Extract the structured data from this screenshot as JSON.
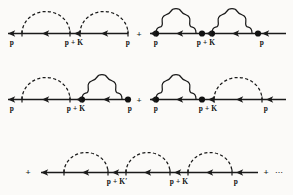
{
  "figure": {
    "kind": "feynman-diagram-series",
    "background_color": "#fbfaf8",
    "ink_color": "#1a1a1a",
    "width": 293,
    "height": 195
  },
  "symbols": {
    "plus": "+",
    "ellipsis": "⋯",
    "momentum_p": "p",
    "momentum_p_plus_K": "p + K",
    "momentum_p_plus_K_prime": "p + K′"
  },
  "rows": [
    {
      "name": "row-1",
      "diagrams": [
        {
          "name": "diagram-1-1",
          "propagator_style": "dashed",
          "loops": 2,
          "labels": [
            "p",
            "p + K",
            "p"
          ]
        },
        {
          "name": "diagram-1-2",
          "propagator_style": "wavy",
          "loops": 2,
          "labels": [
            "p",
            "p + K",
            "p"
          ]
        }
      ],
      "operators": [
        "+"
      ]
    },
    {
      "name": "row-2",
      "diagrams": [
        {
          "name": "diagram-2-1",
          "propagator_style": "mixed-dashed-then-wavy",
          "loops": 2,
          "labels": [
            "p",
            "p + K",
            "p"
          ]
        },
        {
          "name": "diagram-2-2",
          "propagator_style": "mixed-wavy-then-dashed",
          "loops": 2,
          "labels": [
            "p",
            "p + K",
            "p"
          ]
        }
      ],
      "operators": [
        "+"
      ]
    },
    {
      "name": "row-3",
      "diagrams": [
        {
          "name": "diagram-3-1",
          "propagator_style": "dashed",
          "loops": 3,
          "labels": [
            "p + K′",
            "p + K",
            "p"
          ]
        }
      ],
      "operators": [
        "+",
        "+"
      ],
      "trailing": "⋯"
    }
  ],
  "labels": {
    "r1d1_left": "p",
    "r1d1_mid": "p + K",
    "r1d1_right": "p",
    "r1_plus": "+",
    "r1d2_left": "p",
    "r1d2_mid": "p + K",
    "r1d2_right": "p",
    "r2d1_left": "p",
    "r2d1_mid": "p + K",
    "r2d1_right": "p",
    "r2_plus": "+",
    "r2d2_left": "p",
    "r2d2_mid": "p + K",
    "r2d2_right": "p",
    "r3_lead_plus": "+",
    "r3_mid_left": "p + K′",
    "r3_mid_right": "p + K",
    "r3_right": "p",
    "r3_trail_plus": "+",
    "r3_ellipsis": "⋯"
  }
}
